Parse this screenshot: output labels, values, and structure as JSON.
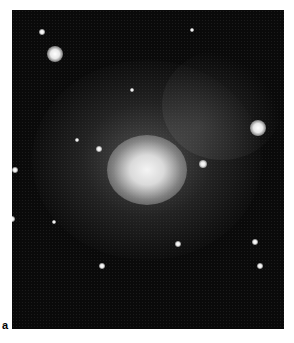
{
  "figure": {
    "panel_label": "a",
    "background_color": "#0a0a0a",
    "stars": [
      {
        "x": 30,
        "y": 22,
        "r": 3
      },
      {
        "x": 43,
        "y": 44,
        "r": 8
      },
      {
        "x": 246,
        "y": 118,
        "r": 8
      },
      {
        "x": 191,
        "y": 154,
        "r": 4
      },
      {
        "x": 87,
        "y": 139,
        "r": 3
      },
      {
        "x": 3,
        "y": 160,
        "r": 3
      },
      {
        "x": 120,
        "y": 80,
        "r": 2
      },
      {
        "x": 65,
        "y": 130,
        "r": 2
      },
      {
        "x": 0,
        "y": 209,
        "r": 3
      },
      {
        "x": 42,
        "y": 212,
        "r": 2
      },
      {
        "x": 166,
        "y": 234,
        "r": 3
      },
      {
        "x": 243,
        "y": 232,
        "r": 3
      },
      {
        "x": 90,
        "y": 256,
        "r": 3
      },
      {
        "x": 248,
        "y": 256,
        "r": 3
      },
      {
        "x": 180,
        "y": 20,
        "r": 2
      }
    ]
  }
}
